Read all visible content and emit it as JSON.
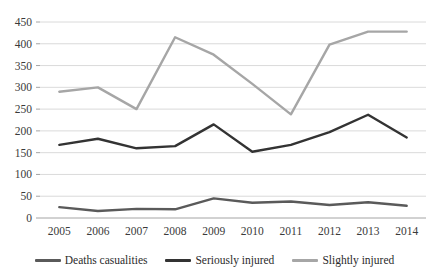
{
  "chart_data": {
    "type": "line",
    "title": "",
    "subtitle": "",
    "xlabel": "",
    "ylabel": "",
    "categories": [
      "2005",
      "2006",
      "2007",
      "2008",
      "2009",
      "2010",
      "2011",
      "2012",
      "2013",
      "2014"
    ],
    "series": [
      {
        "name": "Deaths casualities",
        "color": "#5a5a5a",
        "values": [
          25,
          16,
          21,
          20,
          45,
          35,
          38,
          30,
          36,
          28
        ]
      },
      {
        "name": "Seriously injured",
        "color": "#333333",
        "values": [
          168,
          182,
          160,
          165,
          215,
          152,
          168,
          197,
          237,
          185
        ]
      },
      {
        "name": "Slightly injured",
        "color": "#a6a6a6",
        "values": [
          290,
          300,
          250,
          415,
          375,
          308,
          238,
          398,
          428,
          428
        ]
      }
    ],
    "ylim": [
      0,
      450
    ],
    "yticks": [
      "0",
      "50",
      "100",
      "150",
      "200",
      "250",
      "300",
      "350",
      "400",
      "450"
    ],
    "ytick_values": [
      0,
      50,
      100,
      150,
      200,
      250,
      300,
      350,
      400,
      450
    ],
    "grid": true,
    "legend_position": "bottom",
    "colors": {
      "grid": "#d0d0d0",
      "axis": "#9a9a9a",
      "text": "#2b2b2b",
      "background": "#ffffff"
    }
  }
}
